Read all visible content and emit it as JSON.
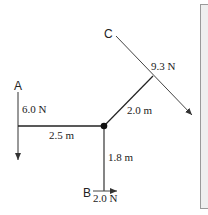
{
  "diagram": {
    "points": {
      "A": "A",
      "B": "B",
      "C": "C"
    },
    "forces": {
      "A": "6.0 N",
      "B": "2.0 N",
      "C": "9.3 N"
    },
    "arms": {
      "horizontal": "2.5 m",
      "vertical": "1.8 m",
      "diagonal": "2.0 m"
    },
    "colors": {
      "line": "#222222",
      "panel_fill": "#efefef",
      "panel_border": "#9a9a9a"
    }
  }
}
